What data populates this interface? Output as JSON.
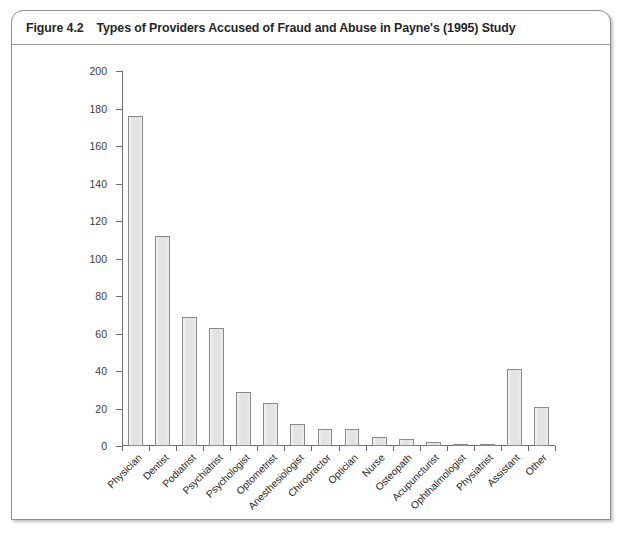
{
  "figure": {
    "number": "Figure 4.2",
    "title": "Types of Providers Accused of Fraud and Abuse in Payne's (1995) Study"
  },
  "colors": {
    "bar_fill": "#e3e3e3",
    "bar_border": "#8a8a8a",
    "axis": "#6f6f6f",
    "card_border": "#8e8e8e",
    "header_text": "#262626"
  },
  "chart_data": {
    "type": "bar",
    "title": "Types of Providers Accused of Fraud and Abuse in Payne's (1995) Study",
    "xlabel": "",
    "ylabel": "",
    "ylim": [
      0,
      200
    ],
    "ytick_step": 20,
    "yticks": [
      0,
      20,
      40,
      60,
      80,
      100,
      120,
      140,
      160,
      180,
      200
    ],
    "ytick_labels": [
      "0",
      "20",
      "40",
      "60",
      "80",
      "100",
      "120",
      "140",
      "160",
      "180",
      "200"
    ],
    "grid": false,
    "legend": null,
    "xtick_label_rotation": -45,
    "categories": [
      "Physician",
      "Dentist",
      "Podiatrist",
      "Psychiatrist",
      "Psychologist",
      "Optometrist",
      "Anesthesiologist",
      "Chiropractor",
      "Optician",
      "Nurse",
      "Osteopath",
      "Acupuncturist",
      "Ophthalmologist",
      "Physiatrist",
      "Assistant",
      "Other"
    ],
    "values": [
      176,
      112,
      69,
      63,
      29,
      23,
      12,
      9,
      9,
      5,
      4,
      2,
      1,
      1,
      41,
      21
    ]
  }
}
